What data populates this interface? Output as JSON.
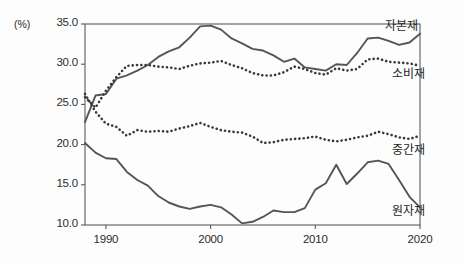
{
  "chart_data": {
    "type": "line",
    "title": "",
    "subtitle": "",
    "unit_label": "(%)",
    "xlabel": "",
    "ylabel": "",
    "xlim": [
      1988,
      2020
    ],
    "ylim": [
      10.0,
      35.0
    ],
    "grid": false,
    "legend_position": "inline-right",
    "x_ticks": [
      "1990",
      "2000",
      "2010",
      "2020"
    ],
    "x_tick_values": [
      1990,
      2000,
      2010,
      2020
    ],
    "y_ticks": [
      "10.0",
      "15.0",
      "20.0",
      "25.0",
      "30.0",
      "35.0"
    ],
    "y_tick_values": [
      10.0,
      15.0,
      20.0,
      25.0,
      30.0,
      35.0
    ],
    "x": [
      1988,
      1989,
      1990,
      1991,
      1992,
      1993,
      1994,
      1995,
      1996,
      1997,
      1998,
      1999,
      2000,
      2001,
      2002,
      2003,
      2004,
      2005,
      2006,
      2007,
      2008,
      2009,
      2010,
      2011,
      2012,
      2013,
      2014,
      2015,
      2016,
      2017,
      2018,
      2019,
      2020
    ],
    "series": [
      {
        "name": "자본재",
        "style": "solid",
        "color": "#555555",
        "label_x": 1997.5,
        "values": [
          22.8,
          26.1,
          26.3,
          28.2,
          28.6,
          29.2,
          29.9,
          30.9,
          31.6,
          32.1,
          33.3,
          34.7,
          34.8,
          34.3,
          33.2,
          32.6,
          31.9,
          31.7,
          31.1,
          30.3,
          30.7,
          29.6,
          29.4,
          29.2,
          30.0,
          29.9,
          31.4,
          33.2,
          33.3,
          32.9,
          32.4,
          32.7,
          33.8
        ]
      },
      {
        "name": "소비재",
        "style": "dotted",
        "color": "#3a3a3a",
        "label_x": 2017.0,
        "values": [
          25.9,
          24.6,
          26.7,
          28.4,
          29.8,
          29.9,
          29.9,
          29.7,
          29.6,
          29.4,
          29.8,
          30.1,
          30.2,
          30.4,
          29.9,
          29.5,
          28.9,
          28.6,
          28.6,
          29.0,
          29.7,
          29.4,
          28.9,
          28.7,
          29.5,
          29.2,
          29.4,
          30.6,
          30.7,
          30.3,
          30.2,
          30.1,
          29.8
        ]
      },
      {
        "name": "중간재",
        "style": "dotted",
        "color": "#3a3a3a",
        "label_x": 2015.5,
        "values": [
          26.3,
          24.1,
          22.6,
          22.2,
          21.1,
          21.8,
          21.6,
          21.7,
          21.6,
          22.0,
          22.3,
          22.7,
          22.2,
          21.8,
          21.6,
          21.5,
          21.0,
          20.2,
          20.3,
          20.6,
          20.7,
          20.8,
          21.0,
          20.6,
          20.4,
          20.6,
          20.9,
          21.1,
          21.6,
          21.3,
          20.9,
          20.7,
          21.1
        ]
      },
      {
        "name": "원자재",
        "style": "solid",
        "color": "#555555",
        "label_x": 2017.5,
        "values": [
          20.2,
          19.0,
          18.3,
          18.2,
          16.6,
          15.6,
          14.9,
          13.6,
          12.8,
          12.3,
          12.0,
          12.3,
          12.5,
          12.2,
          11.3,
          10.2,
          10.4,
          11.0,
          11.8,
          11.6,
          11.6,
          12.1,
          14.4,
          15.2,
          17.5,
          15.1,
          16.4,
          17.8,
          18.0,
          17.6,
          15.6,
          13.5,
          12.2
        ]
      }
    ]
  },
  "axes": {
    "frame_color": "#4d4d4d",
    "tick_color": "#4d4d4d"
  }
}
